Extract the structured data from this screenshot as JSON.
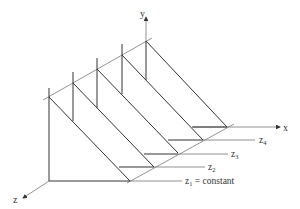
{
  "diagram": {
    "axes": {
      "x_label": "x",
      "y_label": "y",
      "z_label": "z"
    },
    "plane_labels": {
      "z1": {
        "base": "z",
        "sub": "1",
        "suffix": " = constant"
      },
      "z2": {
        "base": "z",
        "sub": "2",
        "suffix": ""
      },
      "z3": {
        "base": "z",
        "sub": "3",
        "suffix": ""
      },
      "z4": {
        "base": "z",
        "sub": "4",
        "suffix": ""
      }
    },
    "colors": {
      "line": "#333333",
      "background": "#ffffff"
    }
  }
}
